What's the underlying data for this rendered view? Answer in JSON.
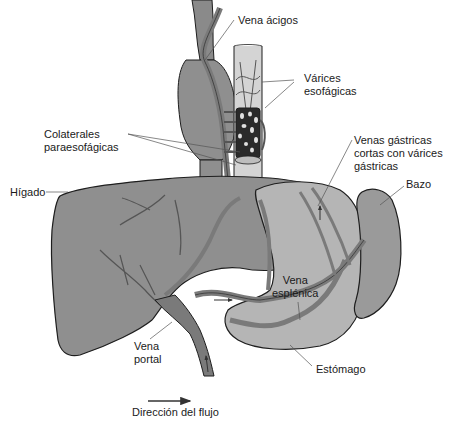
{
  "figure": {
    "colors": {
      "liver": "#8f8f8f",
      "liver_dark": "#6e6e6e",
      "stomach": "#b5b5b5",
      "spleen": "#9a9a9a",
      "vessel": "#7a7a7a",
      "outline": "#1e1e1e",
      "esophagus": "#cfcfcf",
      "varices": "#2a2a2a",
      "leader": "#555555"
    }
  },
  "labels": {
    "vena_acigos": "Vena ácigos",
    "varices_esofagicas": "Várices\nesofágicas",
    "colaterales": "Colaterales\nparaesofágicas",
    "venas_gastricas": "Venas gástricas\ncortas con várices\ngástricas",
    "bazo": "Bazo",
    "higado": "Hígado",
    "vena_esplenica": "Vena\nesplénica",
    "vena_portal": "Vena\nportal",
    "estomago": "Estómago"
  },
  "legend": {
    "flow_direction": "Dirección del flujo"
  }
}
